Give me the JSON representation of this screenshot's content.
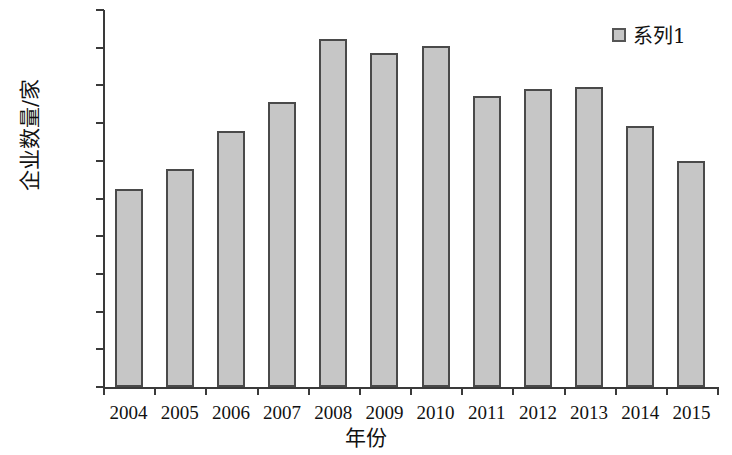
{
  "chart_data": {
    "type": "bar",
    "title": "",
    "xlabel": "年份",
    "ylabel": "企业数量/家",
    "categories": [
      "2004",
      "2005",
      "2006",
      "2007",
      "2008",
      "2009",
      "2010",
      "2011",
      "2012",
      "2013",
      "2014",
      "2015"
    ],
    "values": [
      5250,
      5780,
      6800,
      7560,
      9230,
      8850,
      9050,
      7730,
      7900,
      7970,
      6920,
      6000
    ],
    "series": [
      {
        "name": "系列1",
        "values": [
          5250,
          5780,
          6800,
          7560,
          9230,
          8850,
          9050,
          7730,
          7900,
          7970,
          6920,
          6000
        ]
      }
    ],
    "ylim": [
      0,
      10000
    ],
    "ytick_labels": [
      "10000",
      "9000",
      "8000",
      "7000",
      "6000",
      "5000",
      "4000",
      "3000",
      "2000",
      "1000",
      "0"
    ],
    "ytick_values": [
      10000,
      9000,
      8000,
      7000,
      6000,
      5000,
      4000,
      3000,
      2000,
      1000,
      0
    ],
    "grid": false,
    "legend_position": "top-right",
    "legend_entries": [
      "系列1"
    ],
    "bar_fill_color": "#c6c6c6",
    "bar_border_color": "#4a4a4a",
    "axis_color": "#3a3a3a"
  }
}
